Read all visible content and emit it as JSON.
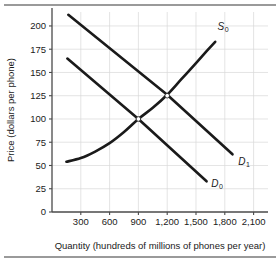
{
  "figure": {
    "name": "supply-and-demand-phones",
    "rule_color": "#9a9a9a",
    "curve_color": "#1a1a1a",
    "grid_color": "#d9d9d9",
    "axis_color": "#4a4a4a"
  },
  "chart_data": {
    "type": "line",
    "title": "",
    "xlabel": "Quantity (hundreds of millions of phones per year)",
    "ylabel": "Price (dollars per phone)",
    "xlim": [
      0,
      2250
    ],
    "ylim": [
      0,
      215
    ],
    "xticks": [
      300,
      600,
      900,
      1200,
      1500,
      1800,
      2100
    ],
    "xticklabels": [
      "300",
      "600",
      "900",
      "1,200",
      "1,500",
      "1,800",
      "2,100"
    ],
    "yticks": [
      0,
      25,
      50,
      75,
      100,
      125,
      150,
      175,
      200
    ],
    "yticklabels": [
      "0",
      "25",
      "50",
      "75",
      "100",
      "125",
      "150",
      "175",
      "200"
    ],
    "grid": true,
    "legend": "inline-curve-labels",
    "series": [
      {
        "name": "S0",
        "label": "S",
        "sublabel": "0",
        "kind": "supply",
        "label_x": 1725,
        "label_y": 196,
        "points": [
          {
            "x": 150,
            "y": 54
          },
          {
            "x": 300,
            "y": 58
          },
          {
            "x": 450,
            "y": 65
          },
          {
            "x": 600,
            "y": 74
          },
          {
            "x": 750,
            "y": 86
          },
          {
            "x": 900,
            "y": 100
          },
          {
            "x": 1050,
            "y": 112
          },
          {
            "x": 1200,
            "y": 126
          },
          {
            "x": 1350,
            "y": 143
          },
          {
            "x": 1500,
            "y": 160
          },
          {
            "x": 1620,
            "y": 174
          },
          {
            "x": 1700,
            "y": 183
          }
        ]
      },
      {
        "name": "D0",
        "label": "D",
        "sublabel": "0",
        "kind": "demand",
        "label_x": 1660,
        "label_y": 27,
        "points": [
          {
            "x": 160,
            "y": 165
          },
          {
            "x": 900,
            "y": 100
          },
          {
            "x": 1610,
            "y": 33
          }
        ]
      },
      {
        "name": "D1",
        "label": "D",
        "sublabel": "1",
        "kind": "demand",
        "label_x": 1940,
        "label_y": 51,
        "points": [
          {
            "x": 170,
            "y": 212
          },
          {
            "x": 1200,
            "y": 126
          },
          {
            "x": 1880,
            "y": 62
          }
        ]
      }
    ],
    "equilibria": [
      {
        "name": "equilibrium-0",
        "x": 900,
        "y": 100
      },
      {
        "name": "equilibrium-1",
        "x": 1200,
        "y": 125
      }
    ]
  }
}
